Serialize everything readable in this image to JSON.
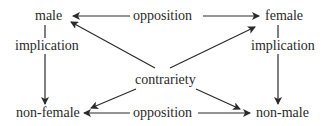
{
  "nodes": {
    "male": "male",
    "female": "female",
    "non_female": "non-female",
    "non_male": "non-male"
  },
  "relations": {
    "opposition_top": "opposition",
    "opposition_bottom": "opposition",
    "implication_left": "implication",
    "implication_right": "implication",
    "contrariety": "contrariety"
  },
  "colors": {
    "ink": "#2a2a2a",
    "background": "#ffffff"
  }
}
